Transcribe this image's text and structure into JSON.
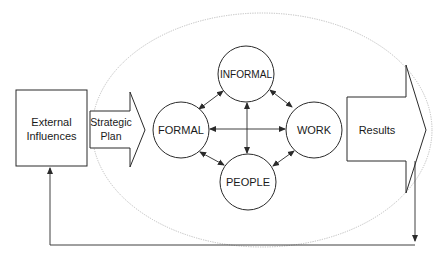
{
  "diagram": {
    "type": "organizational-systems-flow",
    "colors": {
      "stroke": "#2a2a2a",
      "ellipse": "#bdbdbd",
      "background": "#ffffff",
      "text": "#1a1a1a"
    },
    "nodes": {
      "external_influences": {
        "line1": "External",
        "line2": "Influences"
      },
      "strategic_plan": {
        "line1": "Strategic",
        "line2": "Plan"
      },
      "formal": {
        "label": "FORMAL"
      },
      "informal": {
        "label": "INFORMAL"
      },
      "work": {
        "label": "WORK"
      },
      "people": {
        "label": "PEOPLE"
      },
      "results": {
        "label": "Results"
      }
    },
    "edges": [
      {
        "from": "FORMAL",
        "to": "INFORMAL",
        "bidirectional": true
      },
      {
        "from": "INFORMAL",
        "to": "WORK",
        "bidirectional": true
      },
      {
        "from": "WORK",
        "to": "PEOPLE",
        "bidirectional": true
      },
      {
        "from": "PEOPLE",
        "to": "FORMAL",
        "bidirectional": true
      },
      {
        "from": "FORMAL",
        "to": "WORK",
        "bidirectional": true
      },
      {
        "from": "INFORMAL",
        "to": "PEOPLE",
        "bidirectional": true
      },
      {
        "from": "External Influences",
        "to": "Strategic Plan",
        "bidirectional": false
      },
      {
        "from": "Strategic Plan",
        "to": "FORMAL",
        "bidirectional": false
      },
      {
        "from": "WORK",
        "to": "Results",
        "bidirectional": false
      },
      {
        "from": "Results",
        "to": "External Influences",
        "bidirectional": false,
        "kind": "feedback-loop"
      }
    ]
  }
}
